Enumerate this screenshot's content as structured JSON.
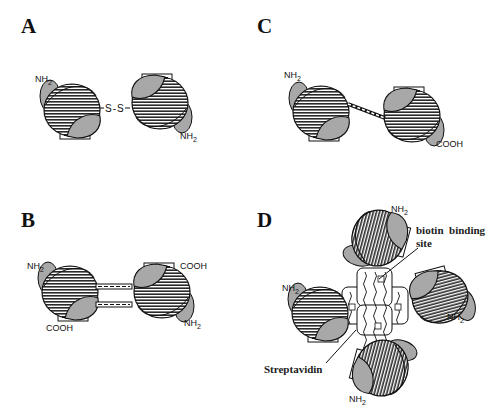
{
  "panels": {
    "A": {
      "label": "A",
      "linker": "S-S",
      "termini": [
        "NH2",
        "NH2"
      ]
    },
    "B": {
      "label": "B",
      "termini": [
        "NH2",
        "COOH",
        "COOH",
        "NH2"
      ]
    },
    "C": {
      "label": "C",
      "termini": [
        "NH2",
        "COOH"
      ]
    },
    "D": {
      "label": "D",
      "termini": [
        "NH2",
        "NH2",
        "NH2",
        "NH2"
      ],
      "annotations": {
        "binding_site": "biotin  binding",
        "binding_site_2": "site",
        "core": "Streptavidin"
      }
    }
  },
  "sub_2": "2",
  "nh": "NH",
  "colors": {
    "hatch": "#2a2a2a",
    "fill": "#a8a8a8",
    "bg": "#ffffff"
  }
}
